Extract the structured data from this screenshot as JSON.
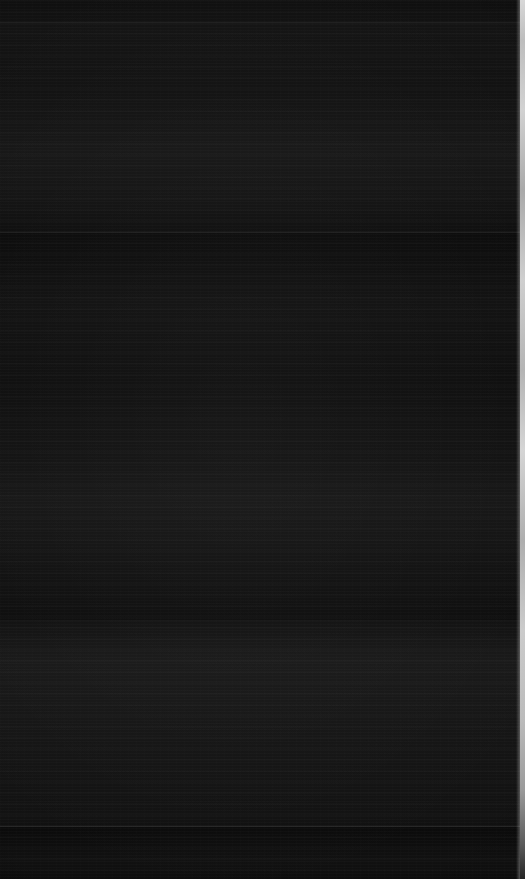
{
  "screen": {
    "width": 525,
    "height": 879,
    "state_label": "",
    "background_color": "#0b0b0b",
    "content_legible": false,
    "description": "Blank dark-mode screen capture; no legible text, icons or controls rendered."
  },
  "regions": {
    "header_band": {
      "name": "header-band",
      "top": 0,
      "height": 22,
      "color": "#101010"
    },
    "upper_band": {
      "name": "upper-content-band",
      "top": 23,
      "height": 209,
      "color": "#121212"
    },
    "content_band": {
      "name": "main-content-band",
      "top": 233,
      "height": 387,
      "color": "#0f0f0f"
    },
    "lower_band": {
      "name": "lower-content-band",
      "top": 621,
      "height": 205,
      "color": "#131313"
    },
    "footer_band": {
      "name": "footer-band",
      "top": 827,
      "height": 52,
      "color": "#0c0c0c"
    }
  },
  "dividers": [
    {
      "name": "header-divider",
      "y": 22,
      "color": "#1a1a1a"
    },
    {
      "name": "upper-divider",
      "y": 232,
      "color": "#1e1e1e"
    },
    {
      "name": "mid-divider",
      "y": 620,
      "color": "#171717"
    },
    {
      "name": "footer-divider",
      "y": 826,
      "color": "#2a2a2a"
    }
  ],
  "edge": {
    "name": "right-edge-strip",
    "x": 520,
    "width": 5,
    "top_color": "#d8d8d8",
    "mid_color": "#c4c4c4",
    "bottom_color": "#242424"
  }
}
